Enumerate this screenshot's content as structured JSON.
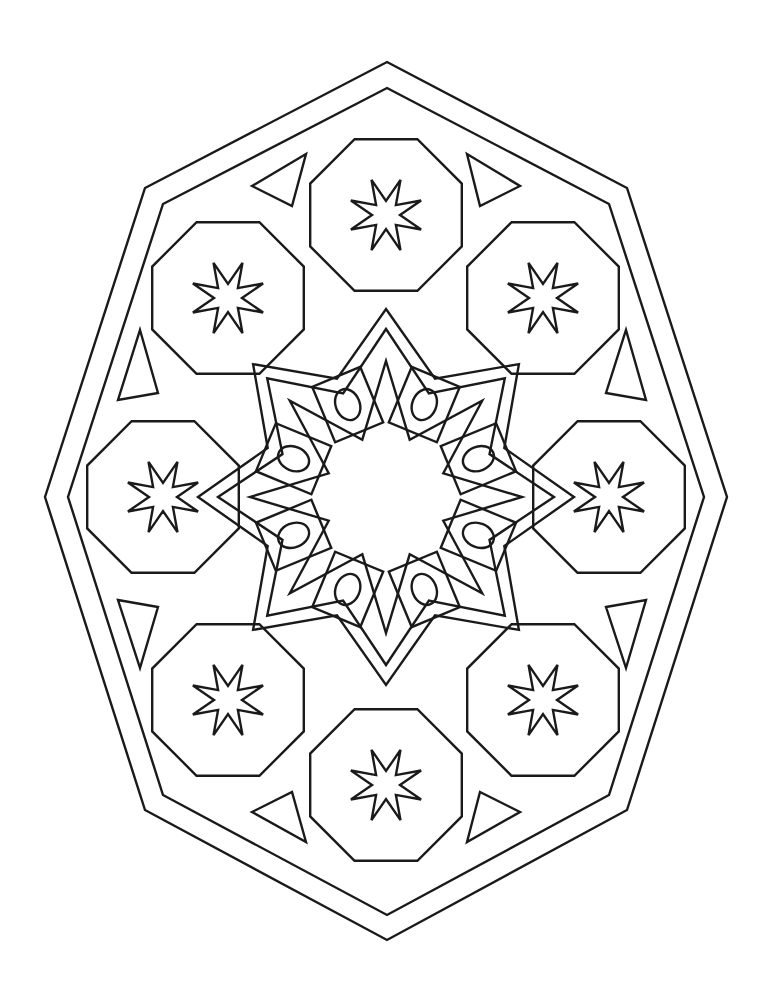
{
  "artwork": {
    "type": "coloring-page",
    "subject": "geometric octagonal mandala",
    "colors": {
      "line": "#1a1a1a",
      "background": "#ffffff"
    },
    "center": [
      386,
      497
    ],
    "outer_border": [
      [
        387,
        62
      ],
      [
        627,
        188
      ],
      [
        727,
        497
      ],
      [
        627,
        810
      ],
      [
        387,
        940
      ],
      [
        145,
        810
      ],
      [
        45,
        497
      ],
      [
        145,
        188
      ]
    ],
    "inner_border": [
      [
        387,
        88
      ],
      [
        609,
        204
      ],
      [
        704,
        497
      ],
      [
        609,
        795
      ],
      [
        387,
        915
      ],
      [
        163,
        795
      ],
      [
        68,
        497
      ],
      [
        163,
        204
      ]
    ],
    "medallions": [
      {
        "name": "top",
        "cx": 386,
        "cy": 215
      },
      {
        "name": "top-right",
        "cx": 543,
        "cy": 298
      },
      {
        "name": "right",
        "cx": 609,
        "cy": 497
      },
      {
        "name": "bottom-right",
        "cx": 543,
        "cy": 700
      },
      {
        "name": "bottom",
        "cx": 386,
        "cy": 785
      },
      {
        "name": "bottom-left",
        "cx": 228,
        "cy": 700
      },
      {
        "name": "left",
        "cx": 163,
        "cy": 497
      },
      {
        "name": "top-left",
        "cx": 228,
        "cy": 298
      }
    ],
    "medallion_radius": 82,
    "star_points": 8,
    "star_outer_radius": 38,
    "star_inner_radius": 14,
    "triangles": [
      [
        [
          252,
          186
        ],
        [
          306,
          154
        ],
        [
          292,
          206
        ]
      ],
      [
        [
          467,
          154
        ],
        [
          520,
          186
        ],
        [
          480,
          206
        ]
      ],
      [
        [
          140,
          330
        ],
        [
          158,
          393
        ],
        [
          118,
          400
        ]
      ],
      [
        [
          626,
          330
        ],
        [
          646,
          400
        ],
        [
          606,
          393
        ]
      ],
      [
        [
          118,
          600
        ],
        [
          158,
          607
        ],
        [
          140,
          668
        ]
      ],
      [
        [
          606,
          607
        ],
        [
          646,
          600
        ],
        [
          626,
          668
        ]
      ],
      [
        [
          252,
          812
        ],
        [
          292,
          792
        ],
        [
          306,
          842
        ]
      ],
      [
        [
          480,
          792
        ],
        [
          520,
          812
        ],
        [
          467,
          842
        ]
      ]
    ],
    "center_band_points": 8,
    "center_ovals": 8
  }
}
